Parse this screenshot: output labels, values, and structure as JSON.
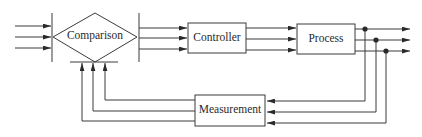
{
  "diagram": {
    "type": "block-diagram",
    "blocks": {
      "comparison": "Comparison",
      "controller": "Controller",
      "process": "Process",
      "measurement": "Measurement"
    },
    "colors": {
      "line": "#3a3a3a",
      "background": "#ffffff"
    },
    "signal_count": 3,
    "flows": [
      {
        "from": "inputs",
        "to": "Comparison",
        "signals": 3
      },
      {
        "from": "Comparison",
        "to": "Controller",
        "signals": 3
      },
      {
        "from": "Controller",
        "to": "Process",
        "signals": 3
      },
      {
        "from": "Process",
        "to": "outputs",
        "signals": 3
      },
      {
        "from": "outputs",
        "to": "Measurement",
        "signals": 3
      },
      {
        "from": "Measurement",
        "to": "Comparison",
        "signals": 3
      }
    ]
  }
}
